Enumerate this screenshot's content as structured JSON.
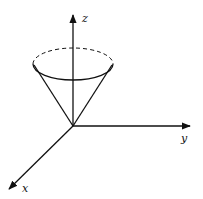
{
  "diagram": {
    "axes": {
      "x": {
        "label": "x"
      },
      "y": {
        "label": "y"
      },
      "z": {
        "label": "z"
      }
    },
    "shape": "cone",
    "colors": {
      "stroke": "#111111",
      "background": "#ffffff"
    }
  }
}
